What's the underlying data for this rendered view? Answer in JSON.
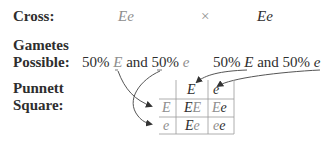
{
  "labels": {
    "cross": "Cross:",
    "gametes_line1": "Gametes",
    "gametes_line2": "Possible:",
    "punnett_line1": "Punnett",
    "punnett_line2": "Square:"
  },
  "cross": {
    "parent1": "Ee",
    "times": "×",
    "parent2": "Ee"
  },
  "gametes": {
    "left": {
      "pct1": "50% ",
      "allele1": "E",
      "and": " and 50% ",
      "allele2": "e"
    },
    "right": {
      "pct1": "50% ",
      "allele1": "E",
      "and": " and 50% ",
      "allele2": "e"
    }
  },
  "punnett": {
    "col_headers": [
      "E",
      "e"
    ],
    "row_headers": [
      "E",
      "e"
    ],
    "cells": [
      [
        {
          "a": "E",
          "b": "E"
        },
        {
          "a": "E",
          "b": "e"
        }
      ],
      [
        {
          "a": "E",
          "b": "e"
        },
        {
          "a": "e",
          "b": "e"
        }
      ]
    ]
  },
  "colors": {
    "maternal": "#8e8e8e",
    "paternal": "#2e2e2e",
    "grid": "#9a9a9a",
    "arrow": "#555555"
  }
}
